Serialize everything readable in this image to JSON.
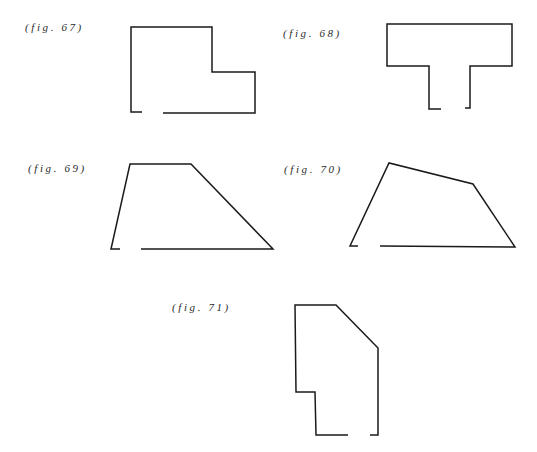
{
  "figures": [
    {
      "id": "67",
      "label": "(fig. 67)",
      "shape": "L-shaped room outline with opening on bottom wall",
      "label_pos": [
        25,
        21
      ],
      "segments": [
        [
          [
            142,
            112
          ],
          [
            131,
            112
          ],
          [
            131,
            27
          ],
          [
            212,
            27
          ],
          [
            212,
            72
          ],
          [
            255,
            72
          ],
          [
            255,
            113
          ],
          [
            163,
            113
          ]
        ]
      ]
    },
    {
      "id": "68",
      "label": "(fig. 68)",
      "shape": "T-shaped room outline with opening at bottom of stem",
      "label_pos": [
        283,
        27
      ],
      "segments": [
        [
          [
            441,
            109
          ],
          [
            429,
            109
          ],
          [
            429,
            66
          ],
          [
            387,
            66
          ],
          [
            387,
            24
          ],
          [
            512,
            24
          ],
          [
            512,
            66
          ],
          [
            470,
            66
          ],
          [
            470,
            108
          ],
          [
            465,
            108
          ]
        ]
      ]
    },
    {
      "id": "69",
      "label": "(fig. 69)",
      "shape": "Trapezoid room outline with opening on bottom wall",
      "label_pos": [
        28,
        162
      ],
      "segments": [
        [
          [
            120,
            249
          ],
          [
            111,
            249
          ],
          [
            130,
            164
          ],
          [
            191,
            164
          ],
          [
            273,
            249
          ],
          [
            141,
            249
          ]
        ]
      ]
    },
    {
      "id": "70",
      "label": "(fig. 70)",
      "shape": "Irregular quadrilateral room outline with opening on bottom wall",
      "label_pos": [
        284,
        163
      ],
      "segments": [
        [
          [
            358,
            246
          ],
          [
            350,
            246
          ],
          [
            389,
            163
          ],
          [
            473,
            184
          ],
          [
            515,
            247
          ],
          [
            380,
            246
          ]
        ]
      ]
    },
    {
      "id": "71",
      "label": "(fig. 71)",
      "shape": "Irregular polygon room outline with chamfered corner and opening on bottom wall",
      "label_pos": [
        172,
        301
      ],
      "segments": [
        [
          [
            348,
            435
          ],
          [
            316,
            435
          ],
          [
            315,
            392
          ],
          [
            296,
            392
          ],
          [
            295,
            305
          ],
          [
            336,
            305
          ],
          [
            378,
            348
          ],
          [
            378,
            435
          ],
          [
            370,
            435
          ]
        ]
      ]
    }
  ],
  "colors": {
    "background": "#ffffff",
    "stroke": "#1a1a1a",
    "label": "#2a2a2a"
  }
}
